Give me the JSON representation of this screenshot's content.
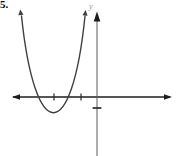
{
  "problem_number": "5.",
  "colors": {
    "background": "#ffffff",
    "axis": "#1c1c1c",
    "yaxis": "#5a5a5a",
    "tick": "#2a2a2a",
    "curve": "#3f3f3f",
    "ylabel": "#8f8f8f",
    "problem": "#000000"
  },
  "chart_data": {
    "type": "line",
    "title": "",
    "xlabel": "",
    "ylabel": "y",
    "grid": false,
    "legend": false,
    "tick_labels_shown": false,
    "x_ticks_approx": [
      -3,
      -1
    ],
    "y_ticks_approx": [
      -1
    ],
    "series": [
      {
        "name": "parabola",
        "description": "Upward-opening parabola; vertex below the x-axis and left of the y-axis; both x-intercepts negative; both branches end in upward arrows",
        "x_intercepts_approx": [
          -4.1,
          -2.2
        ],
        "vertex_approx": [
          -3.1,
          -1.4
        ],
        "points_approx": [
          [
            -4.8,
            3
          ],
          [
            -4.1,
            0
          ],
          [
            -3.1,
            -1.4
          ],
          [
            -2.2,
            0
          ],
          [
            -1.2,
            3
          ]
        ]
      }
    ]
  },
  "figure": {
    "x_axis_path": "M 13 97 H 170",
    "x_axis_arrow_left": "12,97 20,94.2 20,99.8",
    "x_axis_arrow_right": "172,97 164,94.2 164,99.8",
    "y_axis_path": "M 97 15 V 156",
    "y_axis_arrow": "97,11.5 93.7,21.5 100.3,21.5",
    "x_ticks_path": "M 54 93.6 V 100.4 M 81 93.6 V 100.4",
    "y_tick_path": "M 92.6 108 H 101.4",
    "parabola_path": "M 21.5 16 C 35 145, 72 145, 85 16",
    "parabola_arrow_left": "20.3,9.5 23.5,14.7 18.3,15.3",
    "parabola_arrow_right": "85.6,10 87.6,15.75 82.5,15.2"
  }
}
